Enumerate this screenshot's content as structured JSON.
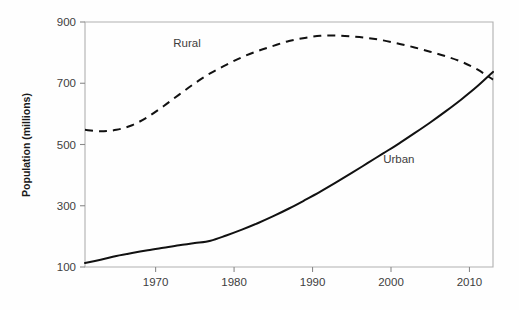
{
  "chart_data": {
    "type": "line",
    "title": "",
    "subtitle": "",
    "xlabel": "",
    "ylabel": "Population (millions)",
    "xlim": [
      1961,
      2013
    ],
    "ylim": [
      100,
      900
    ],
    "grid": false,
    "legend_position": "inline-annotations",
    "x_ticks": [
      1970,
      1980,
      1990,
      2000,
      2010
    ],
    "x_tick_labels": [
      "1970",
      "1980",
      "1990",
      "2000",
      "2010"
    ],
    "y_ticks": [
      100,
      300,
      500,
      700,
      900
    ],
    "y_tick_labels": [
      "100",
      "300",
      "500",
      "700",
      "900"
    ],
    "annotations": [
      {
        "text": "Rural",
        "x": 1974,
        "y": 820
      },
      {
        "text": "Urban",
        "x": 2001,
        "y": 440
      }
    ],
    "series": [
      {
        "name": "Rural",
        "style": "dashed",
        "color": "#111111",
        "x": [
          1961,
          1963,
          1965,
          1967,
          1969,
          1971,
          1973,
          1975,
          1977,
          1979,
          1981,
          1983,
          1985,
          1987,
          1989,
          1991,
          1993,
          1995,
          1997,
          1999,
          2001,
          2003,
          2005,
          2007,
          2009,
          2011,
          2013
        ],
        "values": [
          548,
          543,
          548,
          563,
          590,
          625,
          663,
          700,
          733,
          760,
          785,
          805,
          822,
          838,
          848,
          855,
          856,
          853,
          848,
          840,
          829,
          817,
          803,
          788,
          770,
          745,
          712
        ]
      },
      {
        "name": "Urban",
        "style": "solid",
        "color": "#111111",
        "x": [
          1961,
          1963,
          1965,
          1967,
          1969,
          1971,
          1973,
          1975,
          1977,
          1979,
          1981,
          1983,
          1985,
          1987,
          1989,
          1991,
          1993,
          1995,
          1997,
          1999,
          2001,
          2003,
          2005,
          2007,
          2009,
          2011,
          2013
        ],
        "values": [
          113,
          124,
          136,
          146,
          155,
          163,
          171,
          178,
          186,
          203,
          222,
          243,
          266,
          291,
          318,
          346,
          376,
          407,
          439,
          471,
          503,
          537,
          572,
          609,
          648,
          690,
          737
        ]
      }
    ]
  },
  "figure": {
    "background_color": "#fefefe",
    "axis_color": "#b0b0b0",
    "text_color": "#3d3d3d",
    "line_color": "#111111"
  }
}
